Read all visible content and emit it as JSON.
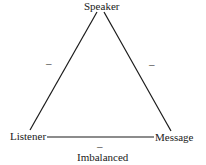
{
  "diagram": {
    "type": "triangle",
    "state": "Imbalanced",
    "nodes": {
      "top": "Speaker",
      "left": "Listener",
      "right": "Message"
    },
    "edges": [
      {
        "from": "Speaker",
        "to": "Listener",
        "sign": "–"
      },
      {
        "from": "Speaker",
        "to": "Message",
        "sign": "–"
      },
      {
        "from": "Listener",
        "to": "Message",
        "sign": "–"
      }
    ],
    "caption": "Imbalanced",
    "colors": {
      "line": "#1a1a1a",
      "background": "#ffffff"
    }
  }
}
